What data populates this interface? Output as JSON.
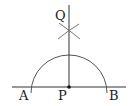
{
  "diagram": {
    "type": "geometric-construction",
    "labels": {
      "Q": "Q",
      "A": "A",
      "P": "P",
      "B": "B"
    },
    "colors": {
      "stroke": "#333333",
      "arc": "#555555",
      "point": "#111111"
    }
  }
}
